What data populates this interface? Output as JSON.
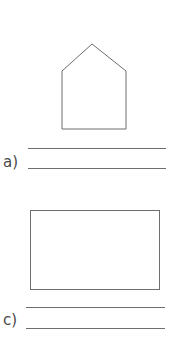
{
  "worksheet": {
    "items": [
      {
        "label": "a)",
        "shape": "pentagon",
        "shape_icon": "pentagon-icon",
        "answer_lines": 2
      },
      {
        "label": "c)",
        "shape": "rectangle",
        "shape_icon": "rectangle-icon",
        "answer_lines": 2
      }
    ]
  },
  "colors": {
    "stroke": "#6e6e6e",
    "label": "#4a4a4a",
    "background": "#ffffff"
  }
}
